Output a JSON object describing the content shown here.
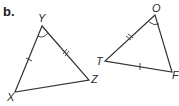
{
  "part_label": "b.",
  "triangle_1": {
    "vertices": {
      "Y": "Y",
      "X": "X",
      "Z": "Z"
    },
    "markings": {
      "YX": "single tick",
      "YZ": "double tick",
      "angle_Y": "single arc"
    }
  },
  "triangle_2": {
    "vertices": {
      "O": "O",
      "T": "T",
      "F": "F"
    },
    "markings": {
      "OT": "double tick",
      "TF": "single tick",
      "angle_O": "single arc"
    }
  },
  "colors": {
    "line": "#333333",
    "background": "#ffffff"
  }
}
